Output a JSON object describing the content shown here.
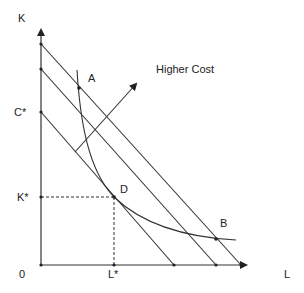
{
  "diagram": {
    "axes": {
      "y_label": "K",
      "x_label": "L",
      "origin_label": "0"
    },
    "tick_labels": {
      "c_star": "C*",
      "k_star": "K*",
      "l_star": "L*"
    },
    "points": {
      "a": "A",
      "b": "B",
      "d": "D"
    },
    "annotation": "Higher Cost",
    "colors": {
      "line": "#333333",
      "background": "#ffffff"
    }
  }
}
